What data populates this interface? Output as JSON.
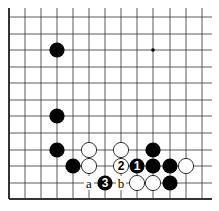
{
  "diagram": {
    "type": "go-board-fragment",
    "grid": {
      "cols_x": [
        9,
        25,
        41,
        57,
        73,
        89,
        105,
        121,
        137,
        153,
        170,
        186,
        202
      ],
      "rows_y": [
        17,
        34,
        50,
        67,
        83,
        100,
        116,
        133,
        150,
        166,
        183,
        199
      ],
      "right_extent": 212,
      "top_extent": 8,
      "edges": [
        "left",
        "bottom"
      ]
    },
    "star_points": [
      {
        "col": 9,
        "row": 2
      }
    ],
    "stones": [
      {
        "color": "black",
        "col": 3,
        "row": 2,
        "label": ""
      },
      {
        "color": "black",
        "col": 3,
        "row": 6,
        "label": ""
      },
      {
        "color": "black",
        "col": 3,
        "row": 8,
        "label": ""
      },
      {
        "color": "white",
        "col": 5,
        "row": 8,
        "label": ""
      },
      {
        "color": "white",
        "col": 7,
        "row": 8,
        "label": ""
      },
      {
        "color": "black",
        "col": 9,
        "row": 8,
        "label": ""
      },
      {
        "color": "black",
        "col": 4,
        "row": 9,
        "label": ""
      },
      {
        "color": "white",
        "col": 5,
        "row": 9,
        "label": ""
      },
      {
        "color": "white",
        "col": 7,
        "row": 9,
        "label": "2"
      },
      {
        "color": "black",
        "col": 8,
        "row": 9,
        "label": "1"
      },
      {
        "color": "black",
        "col": 9,
        "row": 9,
        "label": ""
      },
      {
        "color": "black",
        "col": 10,
        "row": 9,
        "label": ""
      },
      {
        "color": "white",
        "col": 11,
        "row": 9,
        "label": ""
      },
      {
        "color": "black",
        "col": 6,
        "row": 10,
        "label": "3"
      },
      {
        "color": "white",
        "col": 8,
        "row": 10,
        "label": ""
      },
      {
        "color": "white",
        "col": 9,
        "row": 10,
        "label": ""
      },
      {
        "color": "black",
        "col": 10,
        "row": 10,
        "label": ""
      }
    ],
    "marks": [
      {
        "text": "a",
        "col": 5,
        "row": 10
      },
      {
        "text": "b",
        "col": 7,
        "row": 10
      }
    ],
    "colors": {
      "line": "#333333",
      "black": "#000000",
      "white": "#ffffff",
      "background": "#ffffff"
    }
  }
}
